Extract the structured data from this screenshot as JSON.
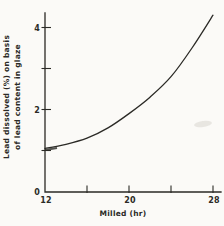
{
  "figure": {
    "background_color": "#fbfaf7",
    "ink_color": "#2b2a26",
    "smudge_color": "#d9d6cf"
  },
  "chart_data": {
    "type": "line",
    "title": "",
    "xlabel": "Milled (hr)",
    "ylabel": "Lead dissolved (%) on basis of lead content in glaze",
    "ylabel_lines": [
      "Lead dissolved (%) on basis",
      "of lead content in glaze"
    ],
    "x": [
      12,
      14,
      16,
      18,
      20,
      22,
      24,
      26,
      28
    ],
    "values": [
      1.05,
      1.15,
      1.3,
      1.55,
      1.9,
      2.3,
      2.8,
      3.5,
      4.3
    ],
    "xlim": [
      12,
      28.8
    ],
    "ylim": [
      0,
      4.4
    ],
    "x_ticks_labeled": [
      12,
      20,
      28
    ],
    "x_ticks_minor": [
      16,
      24
    ],
    "y_ticks_labeled": [
      0,
      2,
      4
    ],
    "y_ticks_minor": [
      1,
      3
    ],
    "legend": null,
    "grid": false,
    "line_color": "#2b2a26"
  }
}
